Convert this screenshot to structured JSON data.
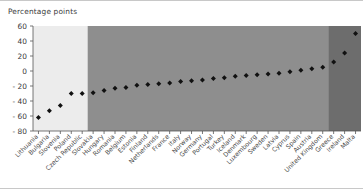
{
  "chart_data": {
    "type": "scatter",
    "title": "",
    "ylabel": "Percentage points",
    "xlabel": "",
    "ylim": [
      -80,
      60
    ],
    "yticks": [
      -80,
      -60,
      -40,
      -20,
      0,
      20,
      40,
      60
    ],
    "ytick_labels": [
      "- 80",
      "- 60",
      "- 40",
      "- 20",
      "0",
      "20",
      "40",
      "60"
    ],
    "grid": false,
    "legend": "none",
    "marker": "diamond",
    "marker_color": "#111111",
    "categories": [
      "Lithuania",
      "Bulgaria",
      "Slovenia",
      "Poland",
      "Czech Republic",
      "Slovakia",
      "Hungary",
      "Romania",
      "Belgium",
      "Estonia",
      "Finland",
      "Netherlands",
      "France",
      "Italy",
      "Norway",
      "Germany",
      "Portugal",
      "Turkey",
      "Iceland",
      "Denmark",
      "Luxembourg",
      "Sweden",
      "Latvia",
      "Cyprus",
      "Spain",
      "Austria",
      "United Kingdom",
      "Greece",
      "Ireland",
      "Malta"
    ],
    "values": [
      -62,
      -53,
      -46,
      -30,
      -30,
      -29,
      -26,
      -23,
      -22,
      -19,
      -18,
      -17,
      -16,
      -14,
      -13,
      -12,
      -10,
      -9,
      -7,
      -6,
      -5,
      -4,
      -3,
      -1,
      1,
      3,
      5,
      12,
      24,
      50
    ],
    "bands": [
      {
        "name": "light-band",
        "color": "#ececec",
        "start_index": 0,
        "end_index": 4
      },
      {
        "name": "mid-band",
        "color": "#8e8e8e",
        "start_index": 5,
        "end_index": 26
      },
      {
        "name": "dark-band",
        "color": "#6d6d6d",
        "start_index": 27,
        "end_index": 29
      }
    ]
  }
}
